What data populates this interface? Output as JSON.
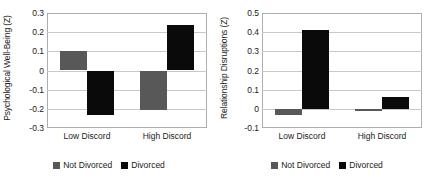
{
  "chart_data": [
    {
      "type": "bar",
      "title": "",
      "ylabel": "Psychological Well-Being (Z)",
      "xlabel": "",
      "categories": [
        "Low Discord",
        "High Discord"
      ],
      "series": [
        {
          "name": "Not Divorced",
          "color": "#585858",
          "values": [
            0.1,
            -0.205
          ]
        },
        {
          "name": "Divorced",
          "color": "#0a0a0a",
          "values": [
            -0.23,
            0.235
          ]
        }
      ],
      "ylim": [
        -0.3,
        0.3
      ],
      "yticks": [
        "0.3",
        "0.2",
        "0.1",
        "0",
        "-0.1",
        "-0.2",
        "-0.3"
      ],
      "ytick_values": [
        0.3,
        0.2,
        0.1,
        0,
        -0.1,
        -0.2,
        -0.3
      ],
      "grid": true,
      "legend_position": "bottom"
    },
    {
      "type": "bar",
      "title": "",
      "ylabel": "Relationship Disruptions (Z)",
      "xlabel": "",
      "categories": [
        "Low Discord",
        "High Discord"
      ],
      "series": [
        {
          "name": "Not Divorced",
          "color": "#585858",
          "values": [
            -0.03,
            -0.01
          ]
        },
        {
          "name": "Divorced",
          "color": "#0a0a0a",
          "values": [
            0.41,
            0.06
          ]
        }
      ],
      "ylim": [
        -0.1,
        0.5
      ],
      "yticks": [
        "0.5",
        "0.4",
        "0.3",
        "0.2",
        "0.1",
        "0",
        "-0.1"
      ],
      "ytick_values": [
        0.5,
        0.4,
        0.3,
        0.2,
        0.1,
        0,
        -0.1
      ],
      "grid": true,
      "legend_position": "bottom"
    }
  ],
  "panels": [
    {
      "ylabel": "Psychological Well-Being (Z)",
      "xticks": [
        "Low Discord",
        "High Discord"
      ],
      "yticks": [
        "0.3",
        "0.2",
        "0.1",
        "0",
        "-0.1",
        "-0.2",
        "-0.3"
      ],
      "legend": [
        {
          "label": "Not Divorced",
          "swatch": "gray"
        },
        {
          "label": "Divorced",
          "swatch": "black"
        }
      ]
    },
    {
      "ylabel": "Relationship Disruptions (Z)",
      "xticks": [
        "Low Discord",
        "High Discord"
      ],
      "yticks": [
        "0.5",
        "0.4",
        "0.3",
        "0.2",
        "0.1",
        "0",
        "-0.1"
      ],
      "legend": [
        {
          "label": "Not Divorced",
          "swatch": "gray"
        },
        {
          "label": "Divorced",
          "swatch": "black"
        }
      ]
    }
  ]
}
